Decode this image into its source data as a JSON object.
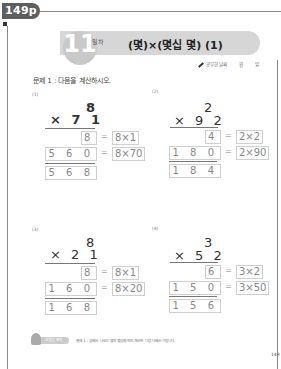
{
  "header": {
    "page_tab": "149p",
    "day_number": "11",
    "day_label": "일차",
    "title": "(몇)×(몇십 몇) (1)",
    "date_row": {
      "label": "공부한 날짜",
      "month": "월",
      "day": "일"
    }
  },
  "instruction": "문제 1 : 다음을 계산하시오.",
  "problems": [
    {
      "label": "(1)",
      "top": "8",
      "bottom": "× 7 1",
      "partial1": "8",
      "partial1_expr": "8×1",
      "partial2": "5 6 0",
      "partial2_expr": "8×70",
      "result": "5 6 8"
    },
    {
      "label": "(2)",
      "top": "2",
      "bottom": "× 9 2",
      "partial1": "4",
      "partial1_expr": "2×2",
      "partial2": "1 8 0",
      "partial2_expr": "2×90",
      "result": "1 8 4"
    },
    {
      "label": "(3)",
      "top": "8",
      "bottom": "× 2 1",
      "partial1": "8",
      "partial1_expr": "8×1",
      "partial2": "1 6 0",
      "partial2_expr": "8×20",
      "result": "1 6 8"
    },
    {
      "label": "(4)",
      "top": "3",
      "bottom": "× 5 2",
      "partial1": "6",
      "partial1_expr": "3×2",
      "partial2": "1 5 0",
      "partial2_expr": "3×50",
      "result": "1 5 6"
    }
  ],
  "equals_sign": "=",
  "footer": {
    "pill_label": "선생님 조언",
    "hint_text": "출제 1 : 곱해서 나오는 몇의 몇십을 먼저 계산한 다음 더해서 구합니다."
  },
  "page_number": "149"
}
